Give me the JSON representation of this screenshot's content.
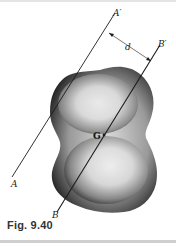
{
  "figure": {
    "caption": "Fig. 9.40",
    "labels": {
      "axis_a_bottom": "A",
      "axis_a_top": "A′",
      "axis_b_bottom": "B",
      "axis_b_top": "B′",
      "distance": "d",
      "centroid": "G"
    },
    "colors": {
      "line": "#1a1a1a",
      "body_dark": "#1f1f1f",
      "body_light": "#f2f2f2",
      "caption": "#333333"
    }
  }
}
